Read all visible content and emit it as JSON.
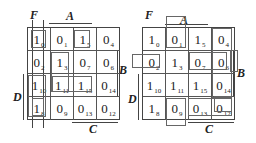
{
  "maps": [
    {
      "id": "left",
      "labels": {
        "F": "F",
        "A": "A",
        "B": "B",
        "C": "C",
        "D": "D"
      },
      "rows": [
        [
          {
            "v": "1",
            "i": "0"
          },
          {
            "v": "0",
            "i": "1"
          },
          {
            "v": "1",
            "i": "5"
          },
          {
            "v": "0",
            "i": "4"
          }
        ],
        [
          {
            "v": "0",
            "i": "2"
          },
          {
            "v": "1",
            "i": "3"
          },
          {
            "v": "0",
            "i": "7"
          },
          {
            "v": "0",
            "i": "6"
          }
        ],
        [
          {
            "v": "1",
            "i": "10"
          },
          {
            "v": "1",
            "i": "11"
          },
          {
            "v": "1",
            "i": "15"
          },
          {
            "v": "0",
            "i": "14"
          }
        ],
        [
          {
            "v": "1",
            "i": "8"
          },
          {
            "v": "0",
            "i": "9"
          },
          {
            "v": "0",
            "i": "13"
          },
          {
            "v": "0",
            "i": "12"
          }
        ]
      ]
    },
    {
      "id": "right",
      "labels": {
        "F": "F",
        "A": "A",
        "B": "B",
        "C": "C",
        "D": "D"
      },
      "rows": [
        [
          {
            "v": "1",
            "i": "0"
          },
          {
            "v": "0",
            "i": "1"
          },
          {
            "v": "1",
            "i": "5"
          },
          {
            "v": "0",
            "i": "4"
          }
        ],
        [
          {
            "v": "0",
            "i": "2"
          },
          {
            "v": "1",
            "i": "3"
          },
          {
            "v": "0",
            "i": "7"
          },
          {
            "v": "0",
            "i": "6"
          }
        ],
        [
          {
            "v": "1",
            "i": "10"
          },
          {
            "v": "1",
            "i": "11"
          },
          {
            "v": "1",
            "i": "15"
          },
          {
            "v": "0",
            "i": "14"
          }
        ],
        [
          {
            "v": "1",
            "i": "8"
          },
          {
            "v": "0",
            "i": "9"
          },
          {
            "v": "0",
            "i": "13"
          },
          {
            "v": "0",
            "i": "12"
          }
        ]
      ]
    }
  ]
}
